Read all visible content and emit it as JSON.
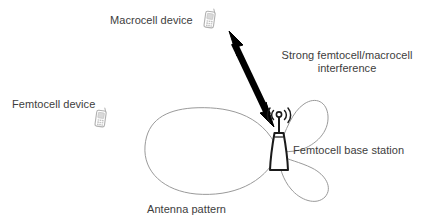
{
  "diagram": {
    "background_color": "#ffffff",
    "labels": {
      "macrocell_device": "Macrocell device",
      "femtocell_device": "Femtocell device",
      "interference_line1": "Strong femtocell/macrocell",
      "interference_line2": "interference",
      "base_station": "Femtocell base station",
      "antenna_pattern": "Antenna pattern"
    },
    "icons": {
      "macrocell_phone": "mobile-phone-icon",
      "femtocell_phone": "mobile-phone-icon",
      "base_station": "cell-tower-icon",
      "interference_arrow": "double-headed-arrow-icon"
    },
    "colors": {
      "text": "#3d3d3d",
      "arrow": "#000000",
      "antenna_pattern_stroke": "#9a9a9a",
      "base_station_stroke": "#1a1a1a",
      "phone_icon_stroke": "#b5b5b5"
    },
    "arrow": {
      "kind": "double-headed",
      "from_x": 273,
      "from_y": 124,
      "to_x": 229,
      "to_y": 32,
      "thickness": 6
    },
    "antenna_pattern": {
      "lobes": [
        {
          "name": "main-lobe",
          "direction": "left",
          "relative_size": "large"
        },
        {
          "name": "side-lobe-upper",
          "direction": "upper-right",
          "relative_size": "small"
        },
        {
          "name": "side-lobe-lower",
          "direction": "lower-right",
          "relative_size": "small"
        }
      ],
      "origin_x": 279,
      "origin_y": 152
    }
  }
}
